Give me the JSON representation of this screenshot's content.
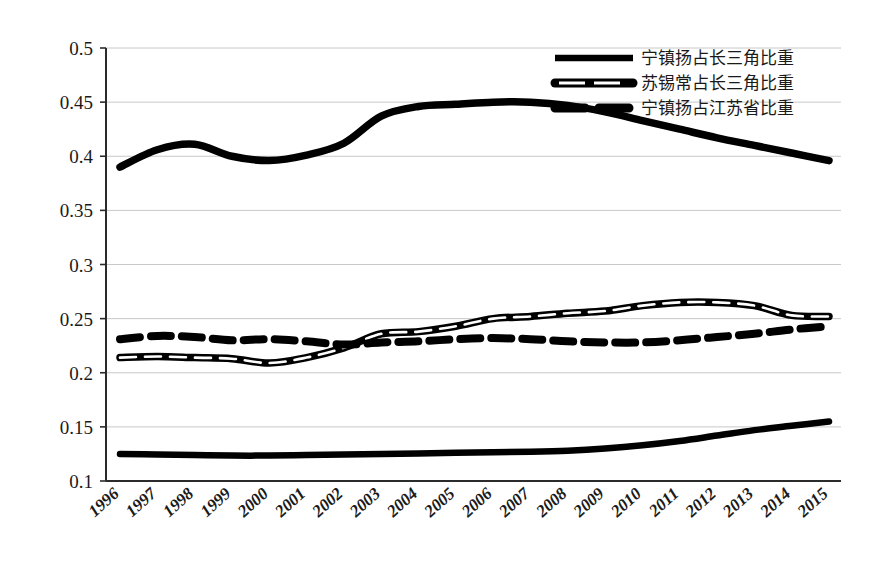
{
  "chart_data": {
    "type": "line",
    "title": "",
    "xlabel": "",
    "ylabel": "",
    "ylim": [
      0.1,
      0.5
    ],
    "ytick_values": [
      0.5,
      0.45,
      0.4,
      0.35,
      0.3,
      0.25,
      0.2,
      0.15,
      0.1
    ],
    "ytick_labels": [
      "0.5",
      "0.45",
      "0.4",
      "0.35",
      "0.3",
      "0.25",
      "0.2",
      "0.15",
      "0.1"
    ],
    "grid": true,
    "grid_axis": "y",
    "legend_position": "top-right",
    "categories": [
      "1996",
      "1997",
      "1998",
      "1999",
      "2000",
      "2001",
      "2002",
      "2003",
      "2004",
      "2005",
      "2006",
      "2007",
      "2008",
      "2009",
      "2010",
      "2011",
      "2012",
      "2013",
      "2014",
      "2015"
    ],
    "series": [
      {
        "name": "宁镇扬占长三角比重",
        "style": "solid-thick",
        "values": [
          0.39,
          0.406,
          0.411,
          0.4,
          0.396,
          0.401,
          0.412,
          0.437,
          0.446,
          0.448,
          0.45,
          0.45,
          0.447,
          0.441,
          0.433,
          0.425,
          0.417,
          0.41,
          0.403,
          0.396
        ]
      },
      {
        "name": "苏锡常占长三角比重",
        "style": "hollow-outlined",
        "values": [
          0.214,
          0.215,
          0.214,
          0.213,
          0.209,
          0.214,
          0.223,
          0.236,
          0.238,
          0.243,
          0.25,
          0.252,
          0.255,
          0.257,
          0.262,
          0.265,
          0.265,
          0.262,
          0.253,
          0.252
        ]
      },
      {
        "name": "宁镇扬占江苏省比重",
        "style": "thick-dashed",
        "values": [
          0.231,
          0.234,
          0.233,
          0.23,
          0.231,
          0.229,
          0.226,
          0.228,
          0.229,
          0.231,
          0.232,
          0.231,
          0.229,
          0.228,
          0.228,
          0.23,
          0.233,
          0.236,
          0.24,
          0.243
        ]
      },
      {
        "name": "",
        "style": "solid-thick-unlabeled",
        "values": [
          0.125,
          0.1245,
          0.124,
          0.1235,
          0.1235,
          0.124,
          0.1245,
          0.125,
          0.1255,
          0.126,
          0.1265,
          0.127,
          0.128,
          0.13,
          0.133,
          0.137,
          0.142,
          0.147,
          0.151,
          0.155
        ]
      }
    ]
  },
  "legend": {
    "items": [
      {
        "label": "宁镇扬占长三角比重",
        "marker": "solid-line-marker"
      },
      {
        "label": "苏锡常占长三角比重",
        "marker": "hollow-line-marker"
      },
      {
        "label": "宁镇扬占江苏省比重",
        "marker": "dashed-line-marker"
      }
    ]
  },
  "colors": {
    "line": "#000000",
    "grid": "#c8c8c8",
    "axis": "#2b2b2b",
    "background": "#ffffff"
  }
}
